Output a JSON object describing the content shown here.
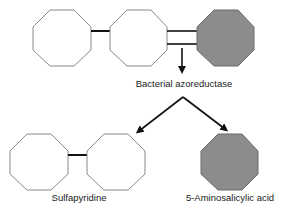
{
  "diagram": {
    "enzyme_label": "Bacterial azoreductase",
    "products": [
      {
        "name": "Sulfapyridine"
      },
      {
        "name": "5-Aminosalicylic acid"
      }
    ],
    "colors": {
      "ring_fill_white": "#ffffff",
      "ring_fill_gray": "#8c8c8c",
      "ring_stroke": "#888888",
      "bond": "#111111",
      "arrow": "#111111"
    }
  }
}
